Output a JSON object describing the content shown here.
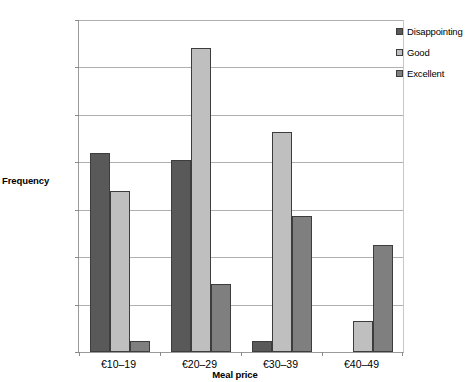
{
  "chart_data": {
    "type": "bar",
    "title": "",
    "xlabel": "Meal price",
    "ylabel": "Frequency",
    "categories": [
      "€10–19",
      "€20–29",
      "€30–39",
      "€40–49"
    ],
    "series": [
      {
        "name": "Disappointing",
        "color": "#595959",
        "values": [
          42.0,
          40.5,
          2.3,
          0
        ]
      },
      {
        "name": "Good",
        "color": "#bfbfbf",
        "values": [
          34.0,
          64.0,
          46.3,
          6.5
        ]
      },
      {
        "name": "Excellent",
        "color": "#7f7f7f",
        "values": [
          2.3,
          14.3,
          28.6,
          22.6
        ]
      }
    ],
    "ylim": [
      0,
      70
    ],
    "ytick_step": 10,
    "yticks": [
      0,
      10,
      20,
      30,
      40,
      50,
      60,
      70
    ],
    "grid": true,
    "legend_position": "top-right"
  },
  "axes": {
    "y_title": "Frequency",
    "x_title": "Meal price"
  }
}
